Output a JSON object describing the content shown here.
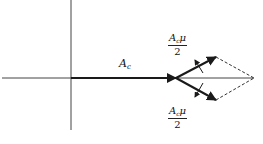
{
  "diagram": {
    "title": "",
    "type": "phasor-diagram",
    "colors": {
      "line": "#222222",
      "background": "#ffffff"
    },
    "axes": {
      "horizontal": {
        "y": 78,
        "x_start": 2,
        "x_end": 254
      },
      "vertical": {
        "x": 71,
        "y_start": 0,
        "y_end": 130
      }
    },
    "carrier": {
      "label_main": "A",
      "label_sub": "c",
      "from": [
        71,
        78
      ],
      "to": [
        176,
        78
      ]
    },
    "upper_sideband": {
      "label": {
        "num_main": "A",
        "num_sub": "c",
        "num_tail": "μ",
        "den": "2"
      },
      "from": [
        176,
        78
      ],
      "to": [
        216,
        57
      ],
      "rotation_direction": "counter-clockwise"
    },
    "lower_sideband": {
      "label": {
        "num_main": "A",
        "num_sub": "c",
        "num_tail": "μ",
        "den": "2"
      },
      "from": [
        176,
        78
      ],
      "to": [
        216,
        100
      ],
      "rotation_direction": "clockwise"
    },
    "resultant_construction": {
      "style": "dashed",
      "apex": [
        254,
        78
      ]
    }
  }
}
